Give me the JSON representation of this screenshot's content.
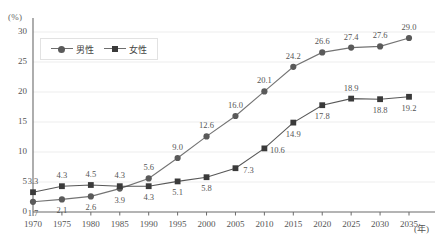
{
  "chart_data": {
    "type": "line",
    "title": "",
    "subtitle": "",
    "xlabel": "(年)",
    "ylabel": "(%)",
    "x": [
      1970,
      1975,
      1980,
      1985,
      1990,
      1995,
      2000,
      2005,
      2010,
      2015,
      2020,
      2025,
      2030,
      2035
    ],
    "categories": [
      "1970",
      "1975",
      "1980",
      "1985",
      "1990",
      "1995",
      "2000",
      "2005",
      "2010",
      "2015",
      "2020",
      "2025",
      "2030",
      "2035"
    ],
    "series": [
      {
        "name": "男性",
        "marker": "circle",
        "color": "#5a5a5a",
        "values": [
          1.7,
          2.1,
          2.6,
          3.9,
          5.6,
          9.0,
          12.6,
          16.0,
          20.1,
          24.2,
          26.6,
          27.4,
          27.6,
          29.0
        ],
        "labels": [
          "1.7",
          "2.1",
          "2.6",
          "3.9",
          "5.6",
          "9.0",
          "12.6",
          "16.0",
          "20.1",
          "24.2",
          "26.6",
          "27.4",
          "27.6",
          "29.0"
        ],
        "label_positions": [
          "below",
          "below",
          "below",
          "below",
          "above",
          "above",
          "above",
          "above",
          "above",
          "above",
          "above",
          "above",
          "above",
          "above"
        ]
      },
      {
        "name": "女性",
        "marker": "square",
        "color": "#3a3a3a",
        "values": [
          3.3,
          4.3,
          4.5,
          4.3,
          4.3,
          5.1,
          5.8,
          7.3,
          10.6,
          14.9,
          17.8,
          18.9,
          18.8,
          19.2
        ],
        "labels": [
          "3.3",
          "4.3",
          "4.5",
          "4.3",
          "4.3",
          "5.1",
          "5.8",
          "7.3",
          "10.6",
          "14.9",
          "17.8",
          "18.9",
          "18.8",
          "19.2"
        ],
        "label_positions": [
          "above",
          "above",
          "above",
          "above",
          "below",
          "below",
          "below",
          "right",
          "right",
          "below",
          "below",
          "above",
          "below",
          "below"
        ]
      }
    ],
    "ylim": [
      0,
      30
    ],
    "yticks": [
      0,
      5,
      10,
      15,
      20,
      25,
      30
    ],
    "ytick_labels": [
      "0",
      "5",
      "10",
      "15",
      "20",
      "25",
      "30"
    ],
    "grid": "horizontal",
    "legend_position": "top-left",
    "legend_entries": [
      "男性",
      "女性"
    ]
  },
  "colors": {
    "male_series": "#5a5a5a",
    "female_series": "#3a3a3a",
    "gridline": "#ededed",
    "axis": "#6b6b6b",
    "text": "#555555",
    "background": "#ffffff"
  }
}
